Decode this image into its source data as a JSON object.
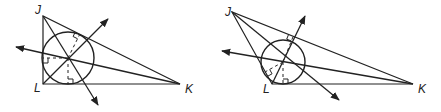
{
  "figures": [
    {
      "name": "right-triangle-incircle",
      "vertices": {
        "J": {
          "label": "J",
          "x": 43,
          "y": 16
        },
        "L": {
          "label": "L",
          "x": 43,
          "y": 84
        },
        "K": {
          "label": "K",
          "x": 180,
          "y": 84
        }
      },
      "incenter": {
        "x": 68,
        "y": 58
      },
      "inradius": 26,
      "label_positions": {
        "J": [
          35,
          14
        ],
        "L": [
          34,
          92
        ],
        "K": [
          185,
          93
        ]
      },
      "rays": [
        {
          "to": [
            108,
            19
          ]
        },
        {
          "to": [
            98,
            105
          ]
        },
        {
          "to": [
            16,
            47
          ]
        }
      ]
    },
    {
      "name": "obtuse-triangle-incircle",
      "vertices": {
        "J": {
          "label": "J",
          "x": 232,
          "y": 12
        },
        "L": {
          "label": "L",
          "x": 272,
          "y": 84
        },
        "K": {
          "label": "K",
          "x": 413,
          "y": 84
        }
      },
      "incenter": {
        "x": 283,
        "y": 62
      },
      "inradius": 22,
      "label_positions": {
        "J": [
          225,
          16
        ],
        "L": [
          263,
          93
        ],
        "K": [
          418,
          93
        ]
      },
      "rays": [
        {
          "to": [
            305,
            16
          ]
        },
        {
          "to": [
            339,
            100
          ]
        },
        {
          "to": [
            222,
            51
          ]
        }
      ]
    }
  ],
  "colors": {
    "stroke": "#222222",
    "background": "#ffffff"
  }
}
